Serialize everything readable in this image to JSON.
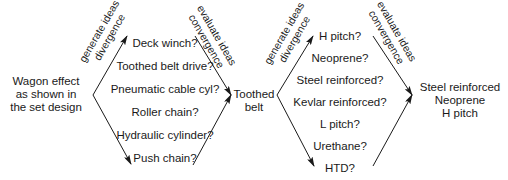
{
  "colors": {
    "ink": "#1a1a1a",
    "background": "#ffffff"
  },
  "stage1": {
    "start": [
      "Wagon effect",
      "as shown in",
      "the set design"
    ],
    "diverge_label": [
      "generate ideas",
      "divergence"
    ],
    "converge_label": [
      "evaluate ideas",
      "convergence"
    ],
    "ideas": [
      "Deck winch?",
      "Toothed belt drive?",
      "Pneumatic cable cyl?",
      "Roller chain?",
      "Hydraulic cylinder?",
      "Push chain?"
    ],
    "result": [
      "Toothed",
      "belt"
    ]
  },
  "stage2": {
    "diverge_label": [
      "generate ideas",
      "divergence"
    ],
    "converge_label": [
      "evaluate ideas",
      "convergence"
    ],
    "ideas": [
      "H pitch?",
      "Neoprene?",
      "Steel reinforced?",
      "Kevlar reinforced?",
      "L pitch?",
      "Urethane?",
      "HTD?"
    ],
    "result": [
      "Steel reinforced",
      "Neoprene",
      "H pitch"
    ]
  }
}
